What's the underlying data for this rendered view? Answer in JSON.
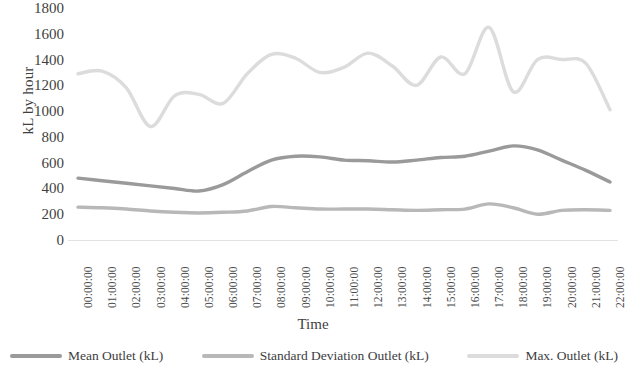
{
  "chart_data": {
    "type": "line",
    "title": "",
    "xlabel": "Time",
    "ylabel": "kL by hour",
    "ylim": [
      0,
      1800
    ],
    "yticks": [
      0,
      200,
      400,
      600,
      800,
      1000,
      1200,
      1400,
      1600,
      1800
    ],
    "grid": false,
    "legend_position": "bottom",
    "smooth": true,
    "categories": [
      "00:00:00",
      "01:00:00",
      "02:00:00",
      "03:00:00",
      "04:00:00",
      "05:00:00",
      "06:00:00",
      "07:00:00",
      "08:00:00",
      "09:00:00",
      "10:00:00",
      "11:00:00",
      "12:00:00",
      "13:00:00",
      "14:00:00",
      "15:00:00",
      "16:00:00",
      "17:00:00",
      "18:00:00",
      "19:00:00",
      "20:00:00",
      "21:00:00",
      "22:00:00"
    ],
    "series": [
      {
        "name": "Mean Outlet (kL)",
        "color": "#9a9a9a",
        "values": [
          480,
          460,
          440,
          420,
          400,
          380,
          430,
          530,
          620,
          650,
          645,
          620,
          615,
          605,
          620,
          640,
          650,
          690,
          730,
          700,
          620,
          540,
          450
        ]
      },
      {
        "name": "Standard Deviation Outlet (kL)",
        "color": "#b8b8b8",
        "values": [
          255,
          250,
          240,
          225,
          215,
          210,
          215,
          225,
          260,
          250,
          240,
          240,
          240,
          235,
          230,
          235,
          240,
          280,
          250,
          200,
          230,
          235,
          230
        ]
      },
      {
        "name": "Max. Outlet (kL)",
        "color": "#dcdcdc",
        "values": [
          1290,
          1310,
          1180,
          880,
          1120,
          1130,
          1060,
          1290,
          1440,
          1410,
          1300,
          1340,
          1450,
          1350,
          1200,
          1420,
          1290,
          1650,
          1150,
          1400,
          1400,
          1370,
          1010
        ]
      }
    ]
  },
  "axis": {
    "y_title": "kL by hour",
    "x_title": "Time"
  },
  "legend": {
    "items": [
      {
        "label": "Mean Outlet (kL)",
        "color": "#9a9a9a",
        "icon": "line-swatch-icon"
      },
      {
        "label": "Standard Deviation Outlet (kL)",
        "color": "#b8b8b8",
        "icon": "line-swatch-icon"
      },
      {
        "label": "Max. Outlet (kL)",
        "color": "#dcdcdc",
        "icon": "line-swatch-icon"
      }
    ]
  }
}
